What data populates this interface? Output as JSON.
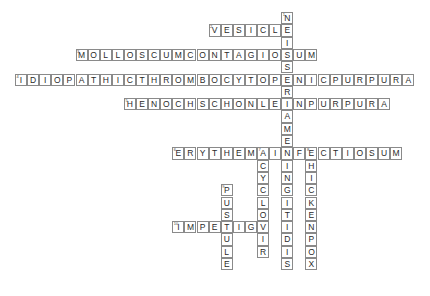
{
  "puzzle": {
    "type": "crossword",
    "grid_origin": {
      "x": 15,
      "y": 12
    },
    "cell_size": {
      "w": 12.1,
      "h": 12.3
    },
    "words": [
      {
        "number": "1",
        "answer": "NEISSERIAMENINGITIDIS",
        "direction": "down",
        "row": 0,
        "col": 22
      },
      {
        "number": "2",
        "answer": "VESICLE",
        "direction": "across",
        "row": 1,
        "col": 16
      },
      {
        "number": "3",
        "answer": "MOLLOSCUMCONTAGIOSUM",
        "direction": "across",
        "row": 3,
        "col": 5
      },
      {
        "number": "4",
        "answer": "IDIOPATHICTHROMBOCYTOPENICPURPURA",
        "direction": "across",
        "row": 5,
        "col": 0
      },
      {
        "number": "5",
        "answer": "HENOCHSCHONLEINPURPURA",
        "direction": "across",
        "row": 7,
        "col": 9
      },
      {
        "number": "6",
        "answer": "ERYTHEMAINFECTIOSUM",
        "direction": "across",
        "row": 11,
        "col": 13
      },
      {
        "number": "7",
        "answer": "ACYCLOVIR",
        "direction": "down",
        "row": 11,
        "col": 20
      },
      {
        "number": "8",
        "answer": "CHICKENPOX",
        "direction": "down",
        "row": 11,
        "col": 24
      },
      {
        "number": "9",
        "answer": "PUSTULE",
        "direction": "down",
        "row": 14,
        "col": 17
      },
      {
        "number": "10",
        "answer": "IMPETIGO",
        "direction": "across",
        "row": 17,
        "col": 13
      }
    ]
  }
}
